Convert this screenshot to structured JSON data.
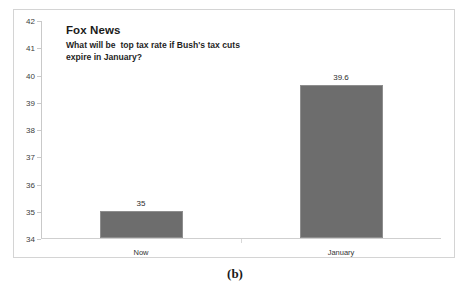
{
  "figure": {
    "caption": "(b)"
  },
  "chart_data": {
    "type": "bar",
    "title": "Fox News",
    "subtitle": "What will be  top tax rate if Bush's tax cuts\nexpire in January?",
    "categories": [
      "Now",
      "January"
    ],
    "values": [
      35,
      39.6
    ],
    "value_labels": [
      "35",
      "39.6"
    ],
    "series": [
      {
        "name": "Top tax rate (%)",
        "values": [
          35,
          39.6
        ]
      }
    ],
    "xlabel": "",
    "ylabel": "",
    "ylim": [
      34,
      42
    ],
    "yticks": [
      34,
      35,
      36,
      37,
      38,
      39,
      40,
      41,
      42
    ],
    "ytick_labels": [
      "34",
      "35",
      "36",
      "37",
      "38",
      "39",
      "40",
      "41",
      "42"
    ],
    "grid": false,
    "legend": false,
    "bar_color": "#6d6d6d",
    "bar_border_color": "#8e8e8e",
    "axis_color": "#c9c9c9",
    "frame_color": "#d4d4d4",
    "background": "#ffffff"
  }
}
